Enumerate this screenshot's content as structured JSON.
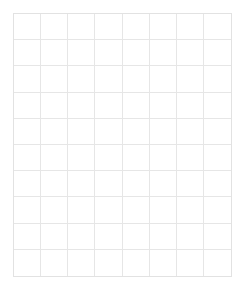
{
  "page": {
    "type": "blank-grid",
    "background_color": "#ffffff",
    "width": 245,
    "height": 291
  },
  "grid": {
    "columns": 8,
    "rows": 10,
    "left": 13,
    "top": 13,
    "right": 232,
    "bottom": 277,
    "width": 219,
    "height": 264,
    "cell_width": 27.4,
    "cell_height": 26.4,
    "line_color": "#e6e6e6",
    "border_color": "#e2e2e2",
    "line_width": 1,
    "line_style": "solid",
    "cell_background": "#ffffff",
    "cells": [
      [
        "",
        "",
        "",
        "",
        "",
        "",
        "",
        ""
      ],
      [
        "",
        "",
        "",
        "",
        "",
        "",
        "",
        ""
      ],
      [
        "",
        "",
        "",
        "",
        "",
        "",
        "",
        ""
      ],
      [
        "",
        "",
        "",
        "",
        "",
        "",
        "",
        ""
      ],
      [
        "",
        "",
        "",
        "",
        "",
        "",
        "",
        ""
      ],
      [
        "",
        "",
        "",
        "",
        "",
        "",
        "",
        ""
      ],
      [
        "",
        "",
        "",
        "",
        "",
        "",
        "",
        ""
      ],
      [
        "",
        "",
        "",
        "",
        "",
        "",
        "",
        ""
      ],
      [
        "",
        "",
        "",
        "",
        "",
        "",
        "",
        ""
      ],
      [
        "",
        "",
        "",
        "",
        "",
        "",
        "",
        ""
      ]
    ]
  }
}
